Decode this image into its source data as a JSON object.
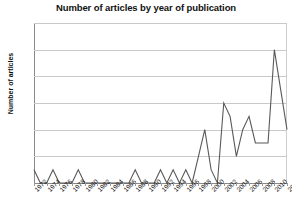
{
  "chart_data": {
    "type": "line",
    "title": "Number of articles by year of publication",
    "xlabel": "",
    "ylabel": "Number of articles",
    "ylim": [
      0,
      12
    ],
    "ytick_values": [
      0,
      2,
      4,
      6,
      8,
      10,
      12
    ],
    "ytick_labels": [
      "0",
      "2",
      "4",
      "6",
      "8",
      "10",
      "12"
    ],
    "xlim": [
      1972,
      2012
    ],
    "xtick_values": [
      1972,
      1974,
      1976,
      1978,
      1980,
      1982,
      1984,
      1986,
      1988,
      1990,
      1992,
      1994,
      1996,
      1998,
      2000,
      2002,
      2004,
      2006,
      2008,
      2010,
      2012
    ],
    "xtick_labels": [
      "1972",
      "1974",
      "1976",
      "1978",
      "1980",
      "1982",
      "1984",
      "1986",
      "1988",
      "1990",
      "1992",
      "1994",
      "1996",
      "1998",
      "2000",
      "2002",
      "2004",
      "2006",
      "2008",
      "2010",
      "2012"
    ],
    "grid": true,
    "legend": false,
    "line_color": "#595959",
    "x": [
      1972,
      1973,
      1974,
      1975,
      1976,
      1977,
      1978,
      1979,
      1980,
      1981,
      1982,
      1983,
      1984,
      1985,
      1986,
      1987,
      1988,
      1989,
      1990,
      1991,
      1992,
      1993,
      1994,
      1995,
      1996,
      1997,
      1998,
      1999,
      2000,
      2001,
      2002,
      2003,
      2004,
      2005,
      2006,
      2007,
      2008,
      2009,
      2010,
      2011,
      2012
    ],
    "values": [
      1,
      0,
      0,
      1,
      0,
      0,
      0,
      1,
      0,
      0,
      0,
      0,
      0,
      0,
      0,
      0,
      1,
      0,
      0,
      0,
      1,
      0,
      1,
      0,
      1,
      0,
      2,
      4,
      1,
      0,
      6,
      5,
      2,
      4,
      5,
      3,
      3,
      3,
      10,
      7,
      4
    ]
  }
}
